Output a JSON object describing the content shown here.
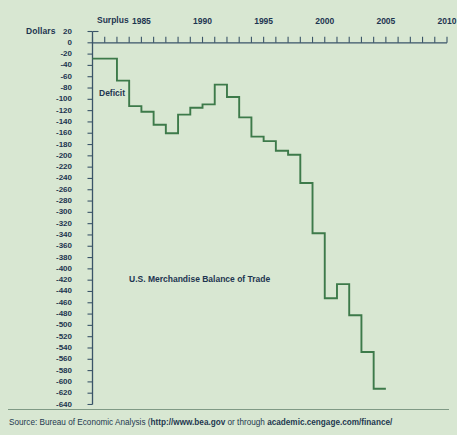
{
  "chart_data": {
    "type": "line",
    "title": "U.S. Merchandise Balance of Trade",
    "ylabel": "Dollars",
    "xlabel": "",
    "grid": false,
    "legend": "none",
    "xlim": [
      1981,
      2010
    ],
    "ylim": [
      -640,
      20
    ],
    "ytick_step": 20,
    "annotations": [
      "Surplus",
      "Deficit"
    ],
    "ytick_labels": [
      "20",
      "0",
      "-20",
      "-40",
      "-60",
      "-80",
      "-100",
      "-120",
      "-140",
      "-160",
      "-180",
      "-200",
      "-220",
      "-240",
      "-260",
      "-280",
      "-300",
      "-320",
      "-340",
      "-360",
      "-380",
      "-400",
      "-420",
      "-440",
      "-460",
      "-480",
      "-500",
      "-520",
      "-540",
      "-560",
      "-580",
      "-600",
      "-620",
      "-640"
    ],
    "xtick_labels": [
      "1985",
      "1990",
      "1995",
      "2000",
      "2005",
      "2010"
    ],
    "xtick_values": [
      1985,
      1990,
      1995,
      2000,
      2005,
      2010
    ],
    "x": [
      1981,
      1982,
      1983,
      1984,
      1985,
      1986,
      1987,
      1988,
      1989,
      1990,
      1991,
      1992,
      1993,
      1994,
      1995,
      1996,
      1997,
      1998,
      1999,
      2000,
      2001,
      2002,
      2003,
      2004
    ],
    "values": [
      -28,
      -28,
      -67,
      -112,
      -122,
      -145,
      -160,
      -127,
      -115,
      -109,
      -74,
      -96,
      -132,
      -166,
      -174,
      -191,
      -198,
      -248,
      -337,
      -452,
      -427,
      -482,
      -547,
      -612
    ]
  },
  "axis": {
    "y_title": "Dollars",
    "surplus_label": "Surplus",
    "deficit_label": "Deficit"
  },
  "footer": {
    "source_prefix": "Source: Bureau of Economic Analysis (",
    "url_1": "http://www.bea.gov",
    "source_mid": " or through ",
    "url_2": "academic.cengage.com/finance/"
  },
  "colors": {
    "background": "#d8e7d2",
    "line": "#3d7a4a",
    "axis": "#3a5468",
    "text": "#1d3550"
  }
}
